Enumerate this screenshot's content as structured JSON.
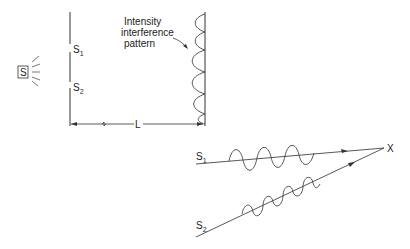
{
  "diagram": {
    "source_label": "S",
    "slits": [
      {
        "label": "S",
        "subscript": "1"
      },
      {
        "label": "S",
        "subscript": "2"
      }
    ],
    "pattern_label_lines": [
      "Intensity",
      "interference",
      "pattern"
    ],
    "distance_label": "L",
    "lower_diagram": {
      "paths": [
        {
          "label": "S",
          "subscript": "1"
        },
        {
          "label": "S",
          "subscript": "2"
        }
      ],
      "meeting_point_label": "X"
    },
    "colors": {
      "stroke": "#333333",
      "background": "#ffffff"
    }
  }
}
